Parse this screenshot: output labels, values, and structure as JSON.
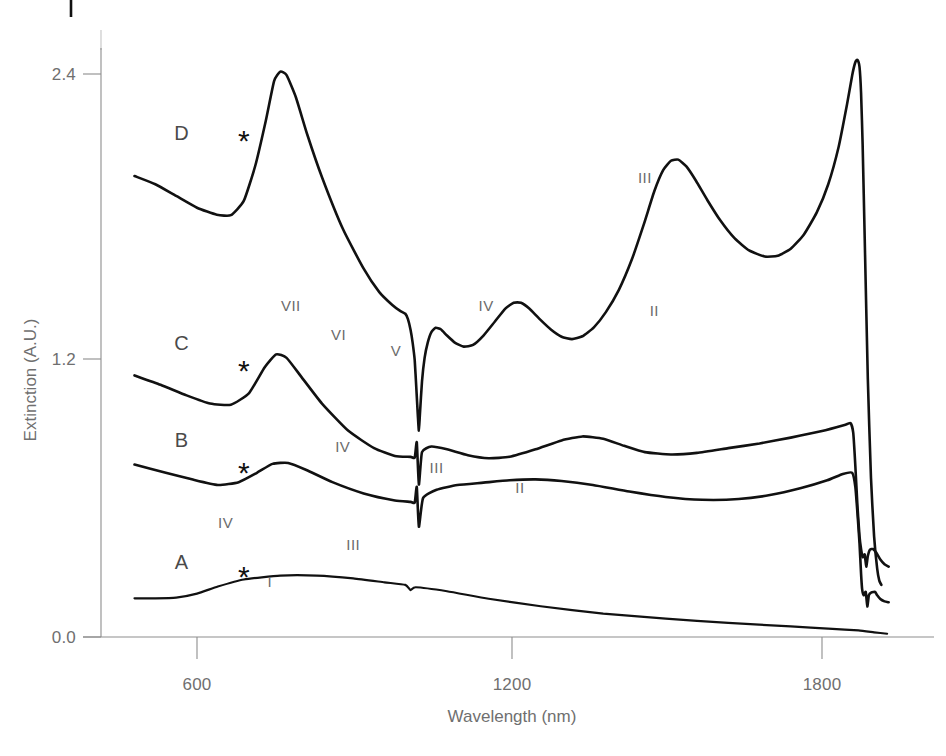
{
  "chart_data": {
    "type": "line",
    "title": "",
    "xlabel": "Wavelength (nm)",
    "ylabel": "Extinction (A.U.)",
    "xlim": [
      470,
      1930
    ],
    "ylim": [
      0.0,
      2.75
    ],
    "xticks": [
      600,
      1200,
      1800
    ],
    "xtick_labels": [
      "600",
      "1200",
      "1800"
    ],
    "yticks": [
      0.0,
      1.2,
      2.4
    ],
    "ytick_labels": [
      "0.0",
      "1.2",
      "2.4"
    ],
    "grid": false,
    "legend": "none",
    "series": [
      {
        "name": "A",
        "label": "A",
        "label_x": 570,
        "label_y": 0.29,
        "marker_symbol": "*",
        "marker_x": 690,
        "marker_y": 0.215,
        "peak_labels": [
          {
            "text": "I",
            "x": 740,
            "y": 0.215
          }
        ],
        "points": [
          [
            480,
            0.165
          ],
          [
            520,
            0.165
          ],
          [
            560,
            0.168
          ],
          [
            600,
            0.185
          ],
          [
            640,
            0.215
          ],
          [
            690,
            0.245
          ],
          [
            760,
            0.262
          ],
          [
            830,
            0.262
          ],
          [
            900,
            0.25
          ],
          [
            960,
            0.233
          ],
          [
            1000,
            0.222
          ],
          [
            1010,
            0.2
          ],
          [
            1020,
            0.212
          ],
          [
            1080,
            0.195
          ],
          [
            1160,
            0.163
          ],
          [
            1260,
            0.131
          ],
          [
            1380,
            0.1
          ],
          [
            1500,
            0.078
          ],
          [
            1620,
            0.06
          ],
          [
            1740,
            0.045
          ],
          [
            1820,
            0.035
          ],
          [
            1870,
            0.028
          ],
          [
            1900,
            0.02
          ],
          [
            1925,
            0.014
          ]
        ]
      },
      {
        "name": "B",
        "label": "B",
        "label_x": 570,
        "label_y": 0.81,
        "marker_symbol": "*",
        "marker_x": 690,
        "marker_y": 0.655,
        "peak_labels": [
          {
            "text": "IV",
            "x": 655,
            "y": 0.465
          },
          {
            "text": "III",
            "x": 900,
            "y": 0.372
          },
          {
            "text": "II",
            "x": 1220,
            "y": 0.615
          }
        ],
        "points": [
          [
            480,
            0.735
          ],
          [
            540,
            0.7
          ],
          [
            590,
            0.672
          ],
          [
            640,
            0.648
          ],
          [
            680,
            0.66
          ],
          [
            715,
            0.7
          ],
          [
            745,
            0.738
          ],
          [
            775,
            0.742
          ],
          [
            810,
            0.712
          ],
          [
            860,
            0.66
          ],
          [
            920,
            0.612
          ],
          [
            980,
            0.582
          ],
          [
            1010,
            0.576
          ],
          [
            1018,
            0.573
          ],
          [
            1022,
            0.64
          ],
          [
            1026,
            0.47
          ],
          [
            1034,
            0.592
          ],
          [
            1060,
            0.628
          ],
          [
            1100,
            0.648
          ],
          [
            1150,
            0.658
          ],
          [
            1200,
            0.668
          ],
          [
            1250,
            0.672
          ],
          [
            1300,
            0.665
          ],
          [
            1360,
            0.648
          ],
          [
            1430,
            0.62
          ],
          [
            1500,
            0.597
          ],
          [
            1570,
            0.585
          ],
          [
            1640,
            0.588
          ],
          [
            1700,
            0.605
          ],
          [
            1760,
            0.635
          ],
          [
            1810,
            0.668
          ],
          [
            1840,
            0.695
          ],
          [
            1858,
            0.7
          ],
          [
            1864,
            0.64
          ],
          [
            1868,
            0.53
          ],
          [
            1872,
            0.4
          ],
          [
            1875,
            0.27
          ],
          [
            1877,
            0.205
          ],
          [
            1880,
            0.178
          ],
          [
            1884,
            0.192
          ],
          [
            1887,
            0.13
          ],
          [
            1890,
            0.178
          ],
          [
            1895,
            0.19
          ],
          [
            1902,
            0.192
          ],
          [
            1906,
            0.178
          ],
          [
            1912,
            0.162
          ],
          [
            1920,
            0.152
          ],
          [
            1928,
            0.148
          ]
        ]
      },
      {
        "name": "C",
        "label": "C",
        "label_x": 570,
        "label_y": 1.225,
        "marker_symbol": "*",
        "marker_x": 690,
        "marker_y": 1.09,
        "peak_labels": [
          {
            "text": "IV",
            "x": 880,
            "y": 0.79
          },
          {
            "text": "III",
            "x": 1060,
            "y": 0.7
          },
          {
            "text": "II",
            "x": 1478,
            "y": 1.37
          }
        ],
        "points": [
          [
            480,
            1.115
          ],
          [
            530,
            1.075
          ],
          [
            580,
            1.03
          ],
          [
            625,
            0.995
          ],
          [
            665,
            0.99
          ],
          [
            700,
            1.04
          ],
          [
            730,
            1.15
          ],
          [
            752,
            1.205
          ],
          [
            772,
            1.19
          ],
          [
            800,
            1.11
          ],
          [
            840,
            0.995
          ],
          [
            890,
            0.88
          ],
          [
            940,
            0.805
          ],
          [
            980,
            0.772
          ],
          [
            1010,
            0.768
          ],
          [
            1018,
            0.765
          ],
          [
            1022,
            0.83
          ],
          [
            1026,
            0.65
          ],
          [
            1032,
            0.788
          ],
          [
            1050,
            0.812
          ],
          [
            1080,
            0.8
          ],
          [
            1120,
            0.775
          ],
          [
            1160,
            0.762
          ],
          [
            1200,
            0.768
          ],
          [
            1250,
            0.8
          ],
          [
            1300,
            0.838
          ],
          [
            1340,
            0.855
          ],
          [
            1380,
            0.845
          ],
          [
            1420,
            0.815
          ],
          [
            1460,
            0.788
          ],
          [
            1510,
            0.778
          ],
          [
            1560,
            0.785
          ],
          [
            1620,
            0.805
          ],
          [
            1680,
            0.825
          ],
          [
            1740,
            0.85
          ],
          [
            1800,
            0.878
          ],
          [
            1845,
            0.905
          ],
          [
            1855,
            0.912
          ],
          [
            1860,
            0.87
          ],
          [
            1864,
            0.73
          ],
          [
            1868,
            0.56
          ],
          [
            1872,
            0.43
          ],
          [
            1875,
            0.375
          ],
          [
            1878,
            0.34
          ],
          [
            1882,
            0.352
          ],
          [
            1885,
            0.3
          ],
          [
            1888,
            0.345
          ],
          [
            1892,
            0.372
          ],
          [
            1898,
            0.375
          ],
          [
            1904,
            0.36
          ],
          [
            1912,
            0.33
          ],
          [
            1920,
            0.31
          ],
          [
            1928,
            0.3
          ]
        ]
      },
      {
        "name": "D",
        "label": "D",
        "label_x": 570,
        "label_y": 2.12,
        "marker_symbol": "*",
        "marker_x": 690,
        "marker_y": 2.07,
        "peak_labels": [
          {
            "text": "VII",
            "x": 780,
            "y": 1.39
          },
          {
            "text": "VI",
            "x": 872,
            "y": 1.268
          },
          {
            "text": "V",
            "x": 982,
            "y": 1.2
          },
          {
            "text": "IV",
            "x": 1155,
            "y": 1.392
          },
          {
            "text": "III",
            "x": 1460,
            "y": 1.935
          }
        ],
        "points": [
          [
            480,
            1.965
          ],
          [
            520,
            1.93
          ],
          [
            560,
            1.88
          ],
          [
            600,
            1.83
          ],
          [
            638,
            1.8
          ],
          [
            665,
            1.798
          ],
          [
            690,
            1.86
          ],
          [
            712,
            2.01
          ],
          [
            732,
            2.2
          ],
          [
            748,
            2.37
          ],
          [
            760,
            2.41
          ],
          [
            772,
            2.395
          ],
          [
            790,
            2.3
          ],
          [
            812,
            2.14
          ],
          [
            840,
            1.96
          ],
          [
            880,
            1.74
          ],
          [
            920,
            1.57
          ],
          [
            950,
            1.47
          ],
          [
            975,
            1.415
          ],
          [
            990,
            1.39
          ],
          [
            1000,
            1.378
          ],
          [
            1005,
            1.355
          ],
          [
            1010,
            1.31
          ],
          [
            1014,
            1.255
          ],
          [
            1018,
            1.18
          ],
          [
            1021,
            1.065
          ],
          [
            1024,
            0.945
          ],
          [
            1026,
            0.88
          ],
          [
            1028,
            0.95
          ],
          [
            1032,
            1.09
          ],
          [
            1037,
            1.19
          ],
          [
            1043,
            1.255
          ],
          [
            1050,
            1.3
          ],
          [
            1058,
            1.318
          ],
          [
            1068,
            1.312
          ],
          [
            1080,
            1.285
          ],
          [
            1095,
            1.255
          ],
          [
            1112,
            1.238
          ],
          [
            1130,
            1.245
          ],
          [
            1150,
            1.285
          ],
          [
            1172,
            1.345
          ],
          [
            1192,
            1.4
          ],
          [
            1208,
            1.425
          ],
          [
            1222,
            1.425
          ],
          [
            1238,
            1.4
          ],
          [
            1258,
            1.355
          ],
          [
            1280,
            1.31
          ],
          [
            1300,
            1.28
          ],
          [
            1320,
            1.27
          ],
          [
            1340,
            1.282
          ],
          [
            1362,
            1.32
          ],
          [
            1385,
            1.385
          ],
          [
            1410,
            1.48
          ],
          [
            1435,
            1.61
          ],
          [
            1458,
            1.76
          ],
          [
            1478,
            1.9
          ],
          [
            1495,
            1.99
          ],
          [
            1510,
            2.03
          ],
          [
            1524,
            2.035
          ],
          [
            1540,
            2.005
          ],
          [
            1558,
            1.945
          ],
          [
            1580,
            1.862
          ],
          [
            1605,
            1.775
          ],
          [
            1632,
            1.7
          ],
          [
            1660,
            1.648
          ],
          [
            1690,
            1.622
          ],
          [
            1715,
            1.625
          ],
          [
            1740,
            1.655
          ],
          [
            1765,
            1.715
          ],
          [
            1790,
            1.81
          ],
          [
            1812,
            1.93
          ],
          [
            1832,
            2.09
          ],
          [
            1848,
            2.27
          ],
          [
            1858,
            2.395
          ],
          [
            1864,
            2.45
          ],
          [
            1868,
            2.46
          ],
          [
            1872,
            2.43
          ],
          [
            1875,
            2.32
          ],
          [
            1878,
            2.1
          ],
          [
            1882,
            1.7
          ],
          [
            1888,
            1.1
          ],
          [
            1894,
            0.68
          ],
          [
            1900,
            0.43
          ],
          [
            1906,
            0.29
          ],
          [
            1910,
            0.24
          ],
          [
            1914,
            0.222
          ]
        ]
      }
    ],
    "annotation_note": "Asterisks (*) mark a common feature near 690 nm on each trace; Roman numerals label successive absorption bands."
  }
}
